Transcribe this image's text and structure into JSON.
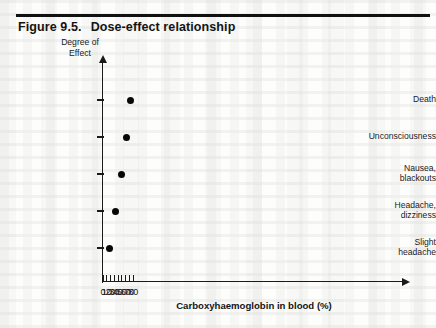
{
  "figure": {
    "number_label": "Figure 9.5.",
    "title": "Dose-effect relationship"
  },
  "chart_data": {
    "type": "scatter",
    "title": "Dose-effect relationship",
    "xlabel": "Carboxyhaemoglobin in blood (%)",
    "ylabel": "Degree of Effect",
    "ylabel_lines": [
      "Degree of",
      "Effect"
    ],
    "grid": false,
    "legend": "none",
    "xlim": [
      0,
      80
    ],
    "xticks": [
      0,
      10,
      20,
      30,
      40,
      50,
      60,
      70,
      80
    ],
    "xticklabels": [
      "0",
      "10",
      "20",
      "30",
      "40",
      "50",
      "60",
      "70",
      "80"
    ],
    "ycategories": [
      "Slight headache",
      "Headache, dizziness",
      "Nausea, blackouts",
      "Unconsciousness",
      "Death"
    ],
    "yticklabel_lines": [
      [
        "Slight",
        "headache"
      ],
      [
        "Headache,",
        "dizziness"
      ],
      [
        "Nausea,",
        "blackouts"
      ],
      [
        "Unconsciousness"
      ],
      [
        "Death"
      ]
    ],
    "marker": "filled-circle",
    "marker_color": "#080808",
    "points": [
      {
        "x": 17,
        "y_category": "Slight headache",
        "y_index": 0
      },
      {
        "x": 33,
        "y_category": "Headache, dizziness",
        "y_index": 1
      },
      {
        "x": 48,
        "y_category": "Nausea, blackouts",
        "y_index": 2
      },
      {
        "x": 62,
        "y_category": "Unconsciousness",
        "y_index": 3
      },
      {
        "x": 74,
        "y_category": "Death",
        "y_index": 4
      }
    ],
    "axis_color": "#1a1a1a",
    "axis_arrows": {
      "x": "right",
      "y": "up"
    }
  }
}
